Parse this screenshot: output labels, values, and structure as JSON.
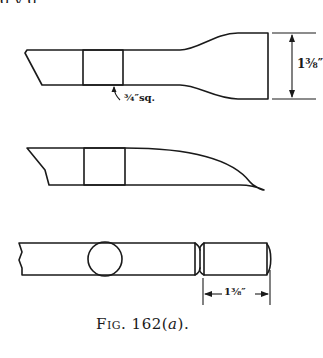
{
  "page": {
    "top_cropped_text": "g               y   g"
  },
  "figure": {
    "caption_prefix": "Fig.",
    "caption_number": "162",
    "caption_suffix_open": "(",
    "caption_suffix_letter": "a",
    "caption_suffix_close": ").",
    "views": [
      {
        "name": "top-view-flared-blade",
        "section_shape": "square",
        "section_label": "¾″sq.",
        "dimension_label": "1⅜″",
        "dimension_orientation": "vertical"
      },
      {
        "name": "side-view-curved-blade",
        "section_shape": "square"
      },
      {
        "name": "round-stock-with-neck",
        "section_shape": "circle",
        "dimension_label": "1⅜″",
        "dimension_orientation": "horizontal"
      }
    ],
    "colors": {
      "ink": "#1a1a1a",
      "paper": "#ffffff"
    }
  }
}
